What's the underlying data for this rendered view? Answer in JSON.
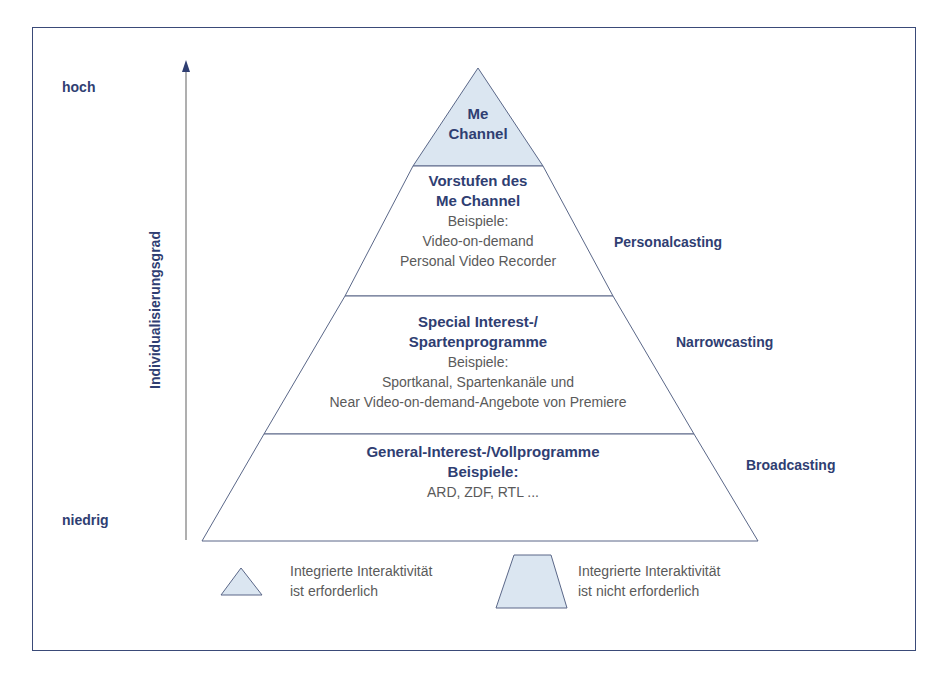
{
  "axis": {
    "label": "Individualisierungsgrad",
    "high": "hoch",
    "low": "niedrig"
  },
  "tiers": [
    {
      "title_lines": [
        "Me",
        "Channel"
      ],
      "fill": "#dbe6f1"
    },
    {
      "title_lines": [
        "Vorstufen des",
        "Me Channel"
      ],
      "examples_label": "Beispiele:",
      "example_lines": [
        "Video-on-demand",
        "Personal Video Recorder"
      ],
      "fill": "#ffffff",
      "category": "Personalcasting"
    },
    {
      "title_lines": [
        "Special Interest-/",
        "Spartenprogramme"
      ],
      "examples_label": "Beispiele:",
      "example_lines": [
        "Sportkanal, Spartenkanäle und",
        "Near Video-on-demand-Angebote von Premiere"
      ],
      "fill": "#ffffff",
      "category": "Narrowcasting"
    },
    {
      "title_lines": [
        "General-Interest-/Vollprogramme"
      ],
      "examples_label": "Beispiele:",
      "example_lines": [
        "ARD, ZDF, RTL ..."
      ],
      "fill": "#ffffff",
      "category": "Broadcasting"
    }
  ],
  "legend": [
    {
      "shape": "triangle-icon",
      "line1": "Integrierte Interaktivität",
      "line2": "ist erforderlich"
    },
    {
      "shape": "trapezoid-icon",
      "line1": "Integrierte Interaktivität",
      "line2": "ist nicht erforderlich"
    }
  ],
  "colors": {
    "frame": "#3a4a78",
    "bold_text": "#2f3e72",
    "regular_text": "#5a5a5a",
    "light_fill": "#dbe6f1",
    "lines": "#5a6788"
  }
}
